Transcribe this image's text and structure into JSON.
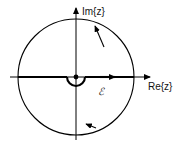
{
  "figure": {
    "background_color": "#ffffff",
    "stroke_color": "#000000",
    "width": 186,
    "height": 146
  },
  "axes": {
    "imaginary": {
      "label": "Im{z}",
      "direction": "up",
      "arrow": true
    },
    "real": {
      "label": "Re{z}",
      "direction": "right",
      "arrow": true
    },
    "origin": {
      "x": 76,
      "y": 77,
      "marker": "dot"
    }
  },
  "contour": {
    "label": "ℰ",
    "label_text": "C",
    "orientation": "counterclockwise",
    "circle": {
      "center_x": 76,
      "center_y": 77,
      "radius": 58
    },
    "indentation": {
      "shape": "semicircle",
      "side": "below-axis",
      "radius": 9,
      "center_x": 76,
      "center_y": 77
    },
    "arrows": [
      {
        "name": "upper-arc-arrow",
        "position": "upper-right-arc"
      },
      {
        "name": "lower-arc-arrow",
        "position": "lower-left-arc"
      },
      {
        "name": "real-axis-arrow",
        "position": "positive-real-segment"
      }
    ]
  }
}
